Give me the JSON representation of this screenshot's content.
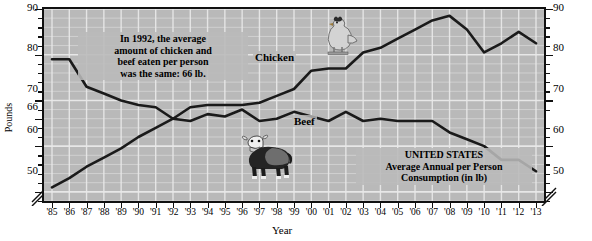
{
  "chart_data": {
    "type": "line",
    "title": "UNITED STATES Average Annual per Person Consumption (in lb)",
    "xlabel": "Year",
    "ylabel": "Pounds",
    "ylim": [
      48,
      90
    ],
    "grid": true,
    "legend_position": "inline-labels",
    "x": [
      "'85",
      "'86",
      "'87",
      "'88",
      "'89",
      "'90",
      "'91",
      "'92",
      "'93",
      "'94",
      "'95",
      "'96",
      "'97",
      "'98",
      "'99",
      "'00",
      "'01",
      "'02",
      "'03",
      "'04",
      "'05",
      "'06",
      "'07",
      "'08",
      "'09",
      "'10",
      "'11",
      "'12",
      "'13"
    ],
    "y_ticks_left": [
      "90",
      "80",
      "70",
      "66",
      "60",
      "50"
    ],
    "y_ticks_right": [
      "90",
      "80",
      "70",
      "60",
      "50"
    ],
    "series": [
      {
        "name": "Chicken",
        "values": [
          51,
          53,
          55.5,
          57.5,
          59.5,
          62,
          64,
          66,
          68.5,
          69,
          69,
          69,
          69.5,
          71,
          72.5,
          76.5,
          77,
          77,
          80.5,
          81.5,
          83.5,
          85.5,
          87.5,
          88.5,
          85.5,
          80.5,
          82.5,
          85,
          82.5
        ]
      },
      {
        "name": "Beef",
        "values": [
          79,
          79,
          73,
          71.5,
          70,
          69,
          68.5,
          66,
          65.5,
          67,
          66.5,
          68,
          65.5,
          66,
          67.5,
          66.5,
          65.5,
          67.5,
          65.5,
          66,
          65.5,
          65.5,
          65.5,
          63,
          61.5,
          60,
          57,
          57,
          54.5
        ]
      }
    ],
    "annotations": [
      {
        "id": "note-1992",
        "text": "In 1992, the average amount of chicken and beef eaten per person was the same: 66 lb.",
        "lines": [
          "In 1992, the average",
          "amount of chicken and",
          "beef eaten per person",
          "was the same: 66 lb."
        ]
      },
      {
        "id": "note-united-states",
        "lines": [
          "UNITED STATES",
          "Average Annual per Person",
          "Consumption (in lb)"
        ]
      }
    ],
    "series_labels": {
      "chicken": "Chicken",
      "beef": "Beef"
    },
    "icons": {
      "chicken": "chicken-illustration",
      "cow": "cow-illustration"
    },
    "colors": {
      "plot_background": "#b9b9b9",
      "grid": "#eaeaea",
      "line": "#1a1a1a",
      "axis": "#111111",
      "page_background": "#ffffff"
    }
  }
}
